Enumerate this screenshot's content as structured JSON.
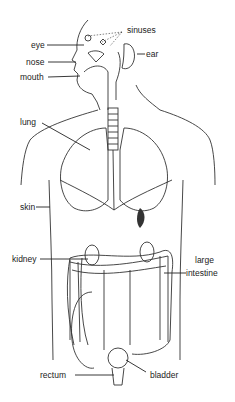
{
  "diagram": {
    "type": "anatomy",
    "labels": {
      "sinuses": "sinuses",
      "eye": "eye",
      "ear": "ear",
      "nose": "nose",
      "mouth": "mouth",
      "lung": "lung",
      "skin": "skin",
      "kidney": "kidney",
      "large_intestine_1": "large",
      "large_intestine_2": "intestine",
      "rectum": "rectum",
      "bladder": "bladder"
    }
  }
}
